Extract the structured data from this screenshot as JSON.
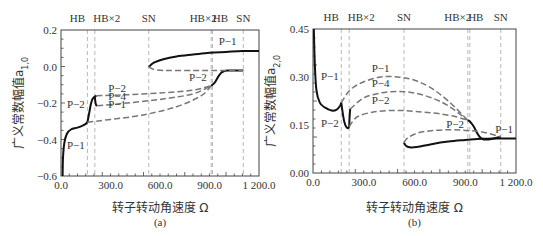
{
  "chart_data": [
    {
      "type": "line",
      "panel": "(a)",
      "caption": "(a)",
      "xlabel": "转子转动角速度 Ω",
      "ylabel": "广义常数幅值a_{1,0}",
      "xlim": [
        0,
        1200
      ],
      "ylim": [
        -0.6,
        0.2
      ],
      "xticks": [
        0,
        300,
        600,
        900,
        1200
      ],
      "xtick_labels": [
        "0.0",
        "300.0",
        "600.0",
        "900.0",
        "1 200.0"
      ],
      "yticks": [
        0.2,
        0.0,
        -0.2,
        -0.4,
        -0.6
      ],
      "ytick_labels": [
        "0.2",
        "0.0",
        "−0.2",
        "−0.4",
        "−0.6"
      ],
      "bifurcations": [
        {
          "label": "HB",
          "x": 160
        },
        {
          "label": "HB×2",
          "x": 205
        },
        {
          "label": "SN",
          "x": 532
        },
        {
          "label": "HB×2",
          "x": 910
        },
        {
          "label": "HB",
          "x": 918
        },
        {
          "label": "SN",
          "x": 1105
        }
      ],
      "top_labels": [
        "HB",
        "HB×2",
        "SN",
        "HB×2",
        "HB",
        "SN"
      ],
      "series": [
        {
          "name": "P-1 stable (low)",
          "style": "solid",
          "x": [
            10,
            12,
            20,
            35,
            60,
            100,
            140,
            160
          ],
          "y": [
            -0.6,
            -0.5,
            -0.42,
            -0.37,
            -0.345,
            -0.335,
            -0.32,
            -0.305
          ]
        },
        {
          "name": "P-2 stable (rise)",
          "style": "solid",
          "x": [
            160,
            170,
            180,
            190,
            205,
            215
          ],
          "y": [
            -0.305,
            -0.26,
            -0.21,
            -0.18,
            -0.165,
            -0.16
          ]
        },
        {
          "name": "P-4 hook",
          "style": "solid",
          "x": [
            205,
            208,
            212,
            220
          ],
          "y": [
            -0.165,
            -0.19,
            -0.21,
            -0.215
          ]
        },
        {
          "name": "P-2 unstable",
          "style": "dashed",
          "x": [
            215,
            400,
            600,
            800,
            910
          ],
          "y": [
            -0.16,
            -0.155,
            -0.145,
            -0.13,
            -0.105
          ]
        },
        {
          "name": "P-4 unstable",
          "style": "dashed",
          "x": [
            220,
            400,
            600,
            800,
            910
          ],
          "y": [
            -0.215,
            -0.2,
            -0.18,
            -0.15,
            -0.105
          ]
        },
        {
          "name": "P-1 unstable",
          "style": "dashed",
          "x": [
            160,
            300,
            500,
            700,
            850,
            910
          ],
          "y": [
            -0.305,
            -0.29,
            -0.265,
            -0.22,
            -0.16,
            -0.105
          ]
        },
        {
          "name": "P-2 stable (high)",
          "style": "solid",
          "x": [
            910,
            930,
            950,
            970,
            990,
            1010,
            1105
          ],
          "y": [
            -0.105,
            -0.09,
            -0.06,
            -0.035,
            -0.025,
            -0.022,
            -0.022
          ]
        },
        {
          "name": "P-1 stable (high)",
          "style": "solid",
          "x": [
            532,
            560,
            620,
            700,
            800,
            900,
            1000,
            1100,
            1200
          ],
          "y": [
            -0.003,
            0.02,
            0.04,
            0.055,
            0.065,
            0.075,
            0.08,
            0.085,
            0.085
          ]
        },
        {
          "name": "P-1 unstable (high)",
          "style": "dashed",
          "x": [
            532,
            560,
            620,
            700,
            800,
            900,
            1000,
            1105
          ],
          "y": [
            -0.003,
            -0.015,
            -0.022,
            -0.022,
            -0.022,
            -0.022,
            -0.022,
            -0.022
          ]
        }
      ],
      "annotations": [
        {
          "text": "P−1",
          "x": 1010,
          "y": 0.12
        },
        {
          "text": "P−2",
          "x": 830,
          "y": -0.08
        },
        {
          "text": "P−2",
          "x": 340,
          "y": -0.14
        },
        {
          "text": "P−4",
          "x": 340,
          "y": -0.185
        },
        {
          "text": "P−1",
          "x": 340,
          "y": -0.23
        },
        {
          "text": "P−2",
          "x": 90,
          "y": -0.23
        },
        {
          "text": "P−1",
          "x": 90,
          "y": -0.45
        }
      ]
    },
    {
      "type": "line",
      "panel": "(b)",
      "caption": "(b)",
      "xlabel": "转子转动角速度 Ω",
      "ylabel": "广义常数幅值a_{2,0}",
      "xlim": [
        0,
        1200
      ],
      "ylim": [
        0,
        0.45
      ],
      "xticks": [
        0,
        300,
        600,
        900,
        1200
      ],
      "xtick_labels": [
        "0.0",
        "300.0",
        "600.0",
        "900.0",
        "1 200.0"
      ],
      "yticks": [
        0.45,
        0.3,
        0.15,
        0.0
      ],
      "ytick_labels": [
        "0.45",
        "0.30",
        "0.15",
        "0.00"
      ],
      "bifurcations": [
        {
          "label": "HB",
          "x": 167
        },
        {
          "label": "HB×2",
          "x": 214
        },
        {
          "label": "SN",
          "x": 538
        },
        {
          "label": "HB×2",
          "x": 915
        },
        {
          "label": "HB",
          "x": 927
        },
        {
          "label": "SN",
          "x": 1110
        }
      ],
      "top_labels": [
        "HB",
        "HB×2",
        "SN",
        "HB×2",
        "HB",
        "SN"
      ],
      "series": [
        {
          "name": "P-1 stable (low)",
          "style": "solid",
          "x": [
            5,
            10,
            20,
            40,
            70,
            110,
            140,
            160,
            167
          ],
          "y": [
            0.45,
            0.35,
            0.26,
            0.22,
            0.205,
            0.195,
            0.198,
            0.21,
            0.22
          ]
        },
        {
          "name": "P-2 stable (drop)",
          "style": "solid",
          "x": [
            167,
            175,
            185,
            195,
            205,
            214
          ],
          "y": [
            0.22,
            0.19,
            0.16,
            0.145,
            0.14,
            0.145
          ]
        },
        {
          "name": "P-4 hook",
          "style": "solid",
          "x": [
            214,
            216,
            218,
            220
          ],
          "y": [
            0.145,
            0.17,
            0.19,
            0.2
          ]
        },
        {
          "name": "P-1 unstable",
          "style": "dashed",
          "x": [
            167,
            220,
            300,
            400,
            500,
            600,
            700,
            800,
            915
          ],
          "y": [
            0.22,
            0.26,
            0.285,
            0.3,
            0.3,
            0.29,
            0.265,
            0.225,
            0.165
          ]
        },
        {
          "name": "P-4 unstable",
          "style": "dashed",
          "x": [
            220,
            300,
            400,
            500,
            600,
            700,
            800,
            915
          ],
          "y": [
            0.2,
            0.235,
            0.25,
            0.255,
            0.25,
            0.235,
            0.21,
            0.165
          ]
        },
        {
          "name": "P-2 unstable",
          "style": "dashed",
          "x": [
            214,
            260,
            350,
            450,
            550,
            650,
            750,
            850,
            915
          ],
          "y": [
            0.145,
            0.175,
            0.19,
            0.195,
            0.195,
            0.19,
            0.185,
            0.175,
            0.165
          ]
        },
        {
          "name": "P-2 stable (high)",
          "style": "solid",
          "x": [
            915,
            930,
            950,
            970,
            990,
            1010,
            1040,
            1070,
            1110
          ],
          "y": [
            0.165,
            0.16,
            0.145,
            0.125,
            0.11,
            0.105,
            0.105,
            0.108,
            0.113
          ]
        },
        {
          "name": "P-1 stable (high)",
          "style": "solid",
          "x": [
            538,
            550,
            580,
            620,
            700,
            800,
            900,
            1000,
            1100,
            1200
          ],
          "y": [
            0.095,
            0.085,
            0.08,
            0.082,
            0.09,
            0.098,
            0.103,
            0.107,
            0.108,
            0.108
          ]
        },
        {
          "name": "P-1 unstable (high)",
          "style": "dashed",
          "x": [
            538,
            560,
            620,
            700,
            800,
            900,
            1000,
            1110
          ],
          "y": [
            0.095,
            0.11,
            0.125,
            0.132,
            0.135,
            0.133,
            0.128,
            0.113
          ]
        }
      ],
      "annotations": [
        {
          "text": "P−1",
          "x": 400,
          "y": 0.315
        },
        {
          "text": "P−4",
          "x": 400,
          "y": 0.27
        },
        {
          "text": "P−2",
          "x": 400,
          "y": 0.215
        },
        {
          "text": "P−1",
          "x": 100,
          "y": 0.29
        },
        {
          "text": "P−2",
          "x": 100,
          "y": 0.145
        },
        {
          "text": "P−2",
          "x": 840,
          "y": 0.14
        },
        {
          "text": "P−1",
          "x": 1130,
          "y": 0.125
        }
      ]
    }
  ]
}
